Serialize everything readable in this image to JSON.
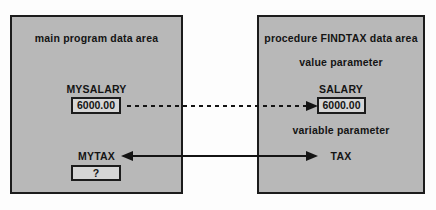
{
  "left_box": {
    "title": "main program data area",
    "salary_label": "MYSALARY",
    "salary_value": "6000.00",
    "tax_label": "MYTAX",
    "tax_value": "?"
  },
  "right_box": {
    "title": "procedure FINDTAX data area",
    "value_param_heading": "value parameter",
    "salary_label": "SALARY",
    "salary_value": "6000.00",
    "variable_param_heading": "variable parameter",
    "tax_label": "TAX"
  },
  "colors": {
    "page_bg": "#fdfdfd",
    "area_fill": "#b8b8b8",
    "area_border": "#1c1c1c",
    "value_box_fill": "#d6d6d6",
    "value_box_border": "#1c1c1c",
    "text": "#141414",
    "arrow": "#141414"
  }
}
